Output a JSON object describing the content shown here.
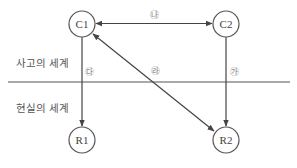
{
  "regions": {
    "thought": "사고의 세계",
    "reality": "현실의 세계"
  },
  "nodes": {
    "c1": "C1",
    "c2": "C2",
    "r1": "R1",
    "r2": "R2"
  },
  "edges": {
    "c1_c2": "㉯",
    "c1_r1": "㉰",
    "r2_c1": "㉱",
    "c2_r2": "㉮"
  },
  "colors": {
    "line": "#444444",
    "divider": "#888888",
    "label": "#555555"
  }
}
